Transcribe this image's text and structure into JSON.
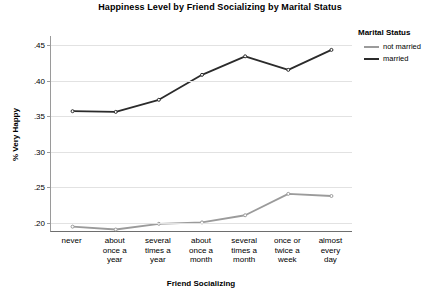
{
  "chart_data": {
    "type": "line",
    "title": "Happiness Level by Friend Socializing by Marital Status",
    "xlabel": "Friend Socializing",
    "ylabel": "% Very Happy",
    "categories": [
      "never",
      "about once a year",
      "several times a year",
      "about once a month",
      "several times a month",
      "once or twice a week",
      "almost every day"
    ],
    "category_lines": [
      [
        "never"
      ],
      [
        "about",
        "once a",
        "year"
      ],
      [
        "several",
        "times a",
        "year"
      ],
      [
        "about",
        "once a",
        "month"
      ],
      [
        "several",
        "times a",
        "month"
      ],
      [
        "once or",
        "twice a",
        "week"
      ],
      [
        "almost",
        "every",
        "day"
      ]
    ],
    "series": [
      {
        "name": "not married",
        "color": "#9b9b9b",
        "values": [
          0.195,
          0.191,
          0.199,
          0.201,
          0.211,
          0.241,
          0.238
        ]
      },
      {
        "name": "married",
        "color": "#2b2b2b",
        "values": [
          0.357,
          0.356,
          0.373,
          0.408,
          0.434,
          0.415,
          0.443
        ]
      }
    ],
    "ylim": [
      0.1875,
      0.4625
    ],
    "yticks": [
      0.2,
      0.25,
      0.3,
      0.35,
      0.4,
      0.45
    ],
    "ytick_labels": [
      ".20",
      ".25",
      ".30",
      ".35",
      ".40",
      ".45"
    ],
    "grid": true,
    "legend_position": "right"
  },
  "legend": {
    "title": "Marital Status",
    "entries": [
      {
        "label": "not married",
        "color": "#9b9b9b"
      },
      {
        "label": "married",
        "color": "#2b2b2b"
      }
    ]
  },
  "colors": {
    "gridline": "#e2e2e2",
    "axis": "#6e6e6e",
    "background": "#ffffff"
  }
}
